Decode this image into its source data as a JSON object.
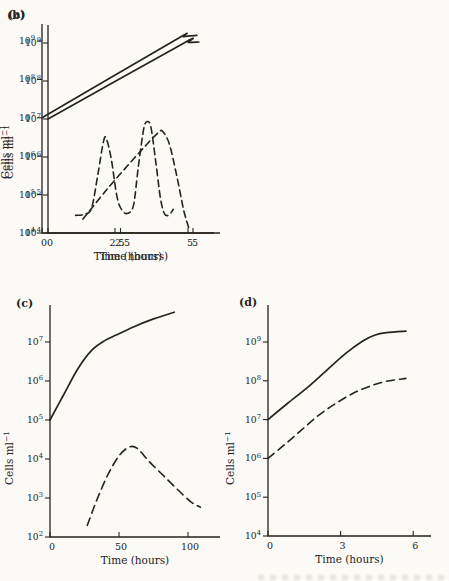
{
  "page": {
    "background": "#fbfaf6",
    "ink": "#27231f"
  },
  "figure": {
    "panel_labels": [
      "(a)",
      "(b)",
      "(c)",
      "(d)"
    ]
  },
  "chart_data": [
    {
      "panel": "(a)",
      "type": "line",
      "title": "",
      "xlabel": "Time (hours)",
      "ylabel": {
        "text": "Cells ml",
        "sup": "−1"
      },
      "x_ticks": [
        {
          "value": 0,
          "label": "0"
        },
        {
          "value": 2.5,
          "label": "2.5"
        },
        {
          "value": 5,
          "label": "5"
        }
      ],
      "y_tick_exponents": [
        4,
        5,
        6,
        7,
        8,
        9
      ],
      "xlim": [
        0,
        5.9
      ],
      "ylim": [
        10000.0,
        3000000000.0
      ],
      "grid": false,
      "legend": false,
      "series": [
        {
          "name": "solid line",
          "style": "solid",
          "points": [
            [
              0,
              10000000.0
            ],
            [
              4.6,
              920000000.0
            ],
            [
              4.85,
              1030000000.0
            ],
            [
              5.2,
              1060000000.0
            ]
          ]
        },
        {
          "name": "dashed line",
          "style": "dashed",
          "points": [
            [
              0.95,
              29000.0
            ],
            [
              1.25,
              31000.0
            ],
            [
              1.5,
              45000.0
            ],
            [
              1.72,
              350000.0
            ],
            [
              1.92,
              2700000.0
            ],
            [
              2.02,
              2900000.0
            ],
            [
              2.18,
              900000.0
            ],
            [
              2.38,
              90000.0
            ],
            [
              2.55,
              40000.0
            ],
            [
              2.75,
              33000.0
            ],
            [
              2.95,
              55000.0
            ],
            [
              3.12,
              600000.0
            ],
            [
              3.3,
              5500000.0
            ],
            [
              3.42,
              8500000.0
            ],
            [
              3.55,
              6000000.0
            ],
            [
              3.72,
              700000.0
            ],
            [
              3.88,
              80000.0
            ],
            [
              4.02,
              32000.0
            ],
            [
              4.18,
              30000.0
            ],
            [
              4.32,
              42000.0
            ]
          ]
        }
      ]
    },
    {
      "panel": "(b)",
      "type": "line",
      "title": "",
      "xlabel": "Time (hours)",
      "ylabel": {
        "text": "Cells ml",
        "sup": "−1"
      },
      "x_ticks": [
        {
          "value": 0,
          "label": "0"
        },
        {
          "value": 2.5,
          "label": "2.5"
        },
        {
          "value": 5,
          "label": "5"
        }
      ],
      "y_tick_exponents": [
        4,
        5,
        6,
        7,
        8,
        9
      ],
      "xlim": [
        0,
        5.9
      ],
      "ylim": [
        10000.0,
        3000000000.0
      ],
      "grid": false,
      "legend": false,
      "series": [
        {
          "name": "solid line",
          "style": "solid",
          "points": [
            [
              0,
              10000000.0
            ],
            [
              4.55,
              1050000000.0
            ],
            [
              4.85,
              1300000000.0
            ],
            [
              5.3,
              1400000000.0
            ]
          ]
        },
        {
          "name": "dashed line",
          "style": "dashed",
          "points": [
            [
              1.4,
              23000.0
            ],
            [
              2.2,
              130000.0
            ],
            [
              3.0,
              650000.0
            ],
            [
              3.7,
              2500000.0
            ],
            [
              4.0,
              4200000.0
            ],
            [
              4.12,
              4500000.0
            ],
            [
              4.35,
              2200000.0
            ],
            [
              4.6,
              350000.0
            ],
            [
              4.85,
              40000.0
            ],
            [
              5.02,
              14000.0
            ]
          ]
        }
      ]
    },
    {
      "panel": "(c)",
      "type": "line",
      "title": "",
      "xlabel": "Time (hours)",
      "ylabel": {
        "text": "Cells ml",
        "sup": "−1"
      },
      "x_ticks": [
        {
          "value": 0,
          "label": "0"
        },
        {
          "value": 50,
          "label": "50"
        },
        {
          "value": 100,
          "label": "100"
        }
      ],
      "y_tick_exponents": [
        2,
        3,
        4,
        5,
        6,
        7
      ],
      "xlim": [
        0,
        120
      ],
      "ylim": [
        100.0,
        150000000.0
      ],
      "grid": false,
      "legend": false,
      "series": [
        {
          "name": "solid line",
          "style": "solid",
          "points": [
            [
              0,
              100000.0
            ],
            [
              10,
              450000.0
            ],
            [
              20,
              2000000.0
            ],
            [
              30,
              6000000.0
            ],
            [
              40,
              11000000.0
            ],
            [
              48,
              15000000.0
            ],
            [
              60,
              24000000.0
            ],
            [
              75,
              39000000.0
            ],
            [
              90,
              58000000.0
            ]
          ]
        },
        {
          "name": "dashed line",
          "style": "dashed",
          "points": [
            [
              27,
              200.0
            ],
            [
              34,
              900.0
            ],
            [
              42,
              4000.0
            ],
            [
              50,
              12000.0
            ],
            [
              57,
              20000.0
            ],
            [
              63,
              19000.0
            ],
            [
              72,
              8500.0
            ],
            [
              82,
              3800.0
            ],
            [
              92,
              1700.0
            ],
            [
              102,
              800.0
            ],
            [
              109,
              580.0
            ]
          ]
        }
      ]
    },
    {
      "panel": "(d)",
      "type": "line",
      "title": "",
      "xlabel": "Time (hours)",
      "ylabel": {
        "text": "Cells ml",
        "sup": "−1"
      },
      "x_ticks": [
        {
          "value": 0,
          "label": "0"
        },
        {
          "value": 3,
          "label": "3"
        },
        {
          "value": 6,
          "label": "6"
        }
      ],
      "y_tick_exponents": [
        4,
        5,
        6,
        7,
        8,
        9
      ],
      "xlim": [
        0,
        6.7
      ],
      "ylim": [
        10000.0,
        4000000000.0
      ],
      "grid": false,
      "legend": false,
      "series": [
        {
          "name": "solid line",
          "style": "solid",
          "points": [
            [
              0,
              10000000.0
            ],
            [
              0.8,
              26000000.0
            ],
            [
              1.6,
              65000000.0
            ],
            [
              2.4,
              180000000.0
            ],
            [
              3.2,
              500000000.0
            ],
            [
              3.9,
              1050000000.0
            ],
            [
              4.4,
              1500000000.0
            ],
            [
              4.9,
              1750000000.0
            ],
            [
              5.7,
              1900000000.0
            ]
          ]
        },
        {
          "name": "dashed line",
          "style": "dashed",
          "points": [
            [
              0,
              1000000.0
            ],
            [
              0.7,
              2300000.0
            ],
            [
              1.4,
              5500000.0
            ],
            [
              2.1,
              13000000.0
            ],
            [
              2.8,
              26000000.0
            ],
            [
              3.5,
              47000000.0
            ],
            [
              4.2,
              72000000.0
            ],
            [
              4.9,
              97000000.0
            ],
            [
              5.7,
              115000000.0
            ]
          ]
        }
      ]
    }
  ]
}
